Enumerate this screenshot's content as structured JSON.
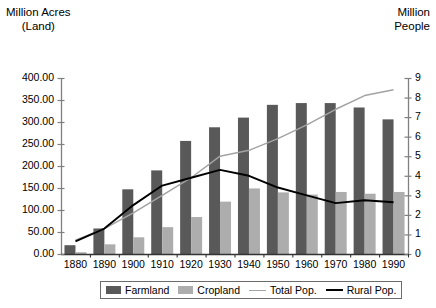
{
  "left_axis_title": "Million Acres\n(Land)",
  "right_axis_title": "Million\nPeople",
  "legend": {
    "items": [
      {
        "label": "Farmland",
        "kind": "box",
        "color": "#595959"
      },
      {
        "label": "Cropland",
        "kind": "box",
        "color": "#adadad"
      },
      {
        "label": "Total Pop.",
        "kind": "line",
        "color": "#a3a3a3"
      },
      {
        "label": "Rural Pop.",
        "kind": "line",
        "color": "#000000"
      }
    ]
  },
  "chart_data": {
    "type": "bar",
    "title": "",
    "subtitle": "",
    "xlabel": "",
    "ylabel": "Million Acres (Land)",
    "y2label": "Million People",
    "grid": false,
    "legend_position": "bottom",
    "categories": [
      "1880",
      "1890",
      "1900",
      "1910",
      "1920",
      "1930",
      "1940",
      "1950",
      "1960",
      "1970",
      "1980",
      "1990"
    ],
    "ylim": [
      0,
      400
    ],
    "yticks": [
      0,
      50,
      100,
      150,
      200,
      250,
      300,
      350,
      400
    ],
    "ytick_labels": [
      "0.00",
      "50.00",
      "100.00",
      "150.00",
      "200.00",
      "250.00",
      "300.00",
      "350.00",
      "400.00"
    ],
    "y2lim": [
      0,
      9
    ],
    "y2ticks": [
      0,
      1,
      2,
      3,
      4,
      5,
      6,
      7,
      8,
      9
    ],
    "y2tick_labels": [
      "0",
      "1",
      "2",
      "3",
      "4",
      "5",
      "6",
      "7",
      "8",
      "9"
    ],
    "series": [
      {
        "name": "Farmland",
        "type": "bar",
        "axis": "left",
        "color": "#595959",
        "values": [
          20,
          58,
          147,
          190,
          257,
          288,
          310,
          339,
          343,
          343,
          333,
          306
        ]
      },
      {
        "name": "Cropland",
        "type": "bar",
        "axis": "left",
        "color": "#adadad",
        "values": [
          4,
          22,
          38,
          61,
          84,
          119,
          149,
          140,
          135,
          141,
          137,
          141
        ]
      },
      {
        "name": "Total Pop.",
        "type": "line",
        "axis": "right",
        "color": "#a3a3a3",
        "values": [
          0.7,
          1.3,
          2.1,
          3.0,
          3.9,
          5.0,
          5.3,
          5.9,
          6.6,
          7.4,
          8.1,
          8.4
        ]
      },
      {
        "name": "Rural Pop.",
        "type": "line",
        "axis": "right",
        "color": "#000000",
        "values": [
          0.65,
          1.3,
          2.5,
          3.5,
          3.9,
          4.3,
          4.0,
          3.4,
          3.0,
          2.6,
          2.75,
          2.65
        ]
      }
    ]
  }
}
